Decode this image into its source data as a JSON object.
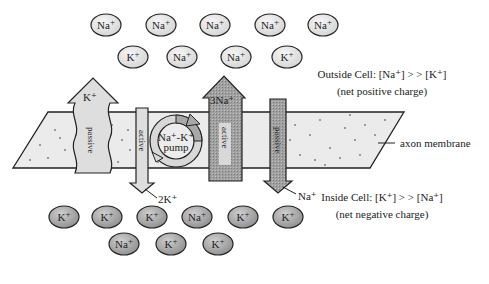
{
  "diagram": {
    "outside_ions": [
      {
        "label": "Na",
        "sup": "+",
        "x": 106,
        "y": 25
      },
      {
        "label": "Na",
        "sup": "+",
        "x": 161,
        "y": 25
      },
      {
        "label": "Na",
        "sup": "+",
        "x": 215,
        "y": 25
      },
      {
        "label": "Na",
        "sup": "+",
        "x": 270,
        "y": 25
      },
      {
        "label": "Na",
        "sup": "+",
        "x": 323,
        "y": 25
      },
      {
        "label": "K",
        "sup": "+",
        "x": 133,
        "y": 57
      },
      {
        "label": "Na",
        "sup": "+",
        "x": 182,
        "y": 57
      },
      {
        "label": "Na",
        "sup": "+",
        "x": 236,
        "y": 57
      },
      {
        "label": "K",
        "sup": "+",
        "x": 287,
        "y": 57
      }
    ],
    "inside_ions": [
      {
        "label": "K",
        "sup": "+",
        "x": 64,
        "y": 217
      },
      {
        "label": "K",
        "sup": "+",
        "x": 107,
        "y": 217
      },
      {
        "label": "K",
        "sup": "+",
        "x": 152,
        "y": 217
      },
      {
        "label": "Na",
        "sup": "+",
        "x": 197,
        "y": 217
      },
      {
        "label": "K",
        "sup": "+",
        "x": 243,
        "y": 217
      },
      {
        "label": "K",
        "sup": "+",
        "x": 288,
        "y": 217
      },
      {
        "label": "Na",
        "sup": "+",
        "x": 124,
        "y": 244
      },
      {
        "label": "K",
        "sup": "+",
        "x": 171,
        "y": 244
      },
      {
        "label": "K",
        "sup": "+",
        "x": 218,
        "y": 244
      }
    ],
    "outside_label": {
      "line1": "Outside Cell: [Na⁺] > > [K⁺]",
      "line2": "(net positive charge)"
    },
    "inside_label": {
      "line1": "Inside Cell: [K⁺] > > [Na⁺]",
      "line2": "(net negative charge)"
    },
    "membrane_label": "axon membrane",
    "arrows": {
      "k_passive": {
        "ion": "K⁺",
        "type": "passive"
      },
      "k_active": {
        "ion": "2K⁺",
        "type": "active"
      },
      "pump": {
        "line1": "Na⁺-K⁺",
        "line2": "pump"
      },
      "na_active": {
        "ion": "3Na⁺",
        "type": "active"
      },
      "na_passive": {
        "ion": "Na⁺",
        "type": "passive"
      }
    },
    "colors": {
      "membrane_fill": "#e9e9e9",
      "light_arrow": "#dcdcdc",
      "dark_arrow": "#9a9a9a",
      "ion_outside": "#e6e6e6",
      "ion_inside": "#a8a8a8",
      "stroke": "#222222"
    }
  }
}
